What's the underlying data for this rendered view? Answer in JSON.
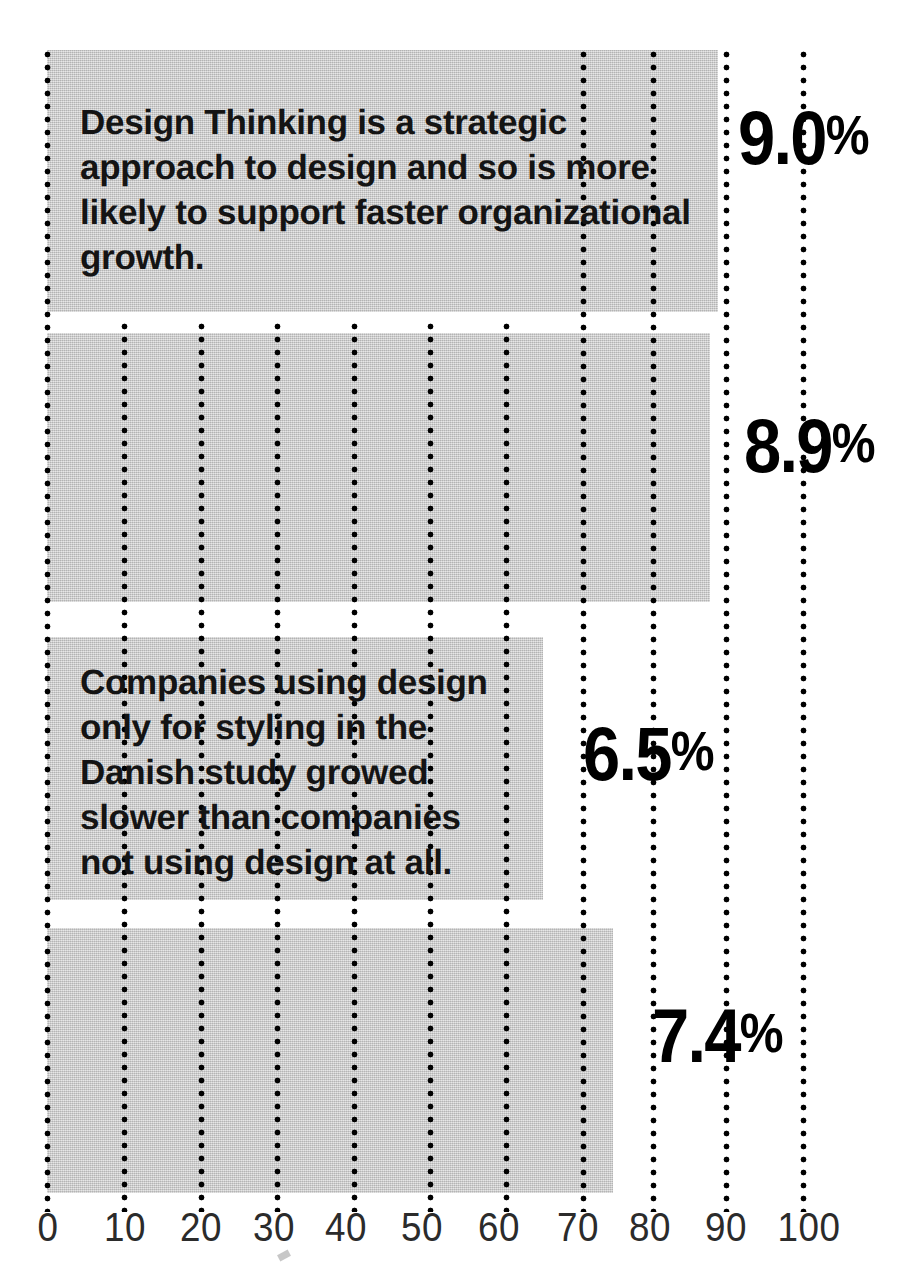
{
  "chart_data": {
    "type": "bar",
    "orientation": "horizontal",
    "title": "",
    "subtitle": "",
    "xlabel": "",
    "ylabel": "",
    "xlim": [
      0,
      100
    ],
    "grid": true,
    "grid_axis": "x",
    "legend": "none",
    "categories": [
      "Bar 1",
      "Bar 2",
      "Bar 3",
      "Bar 4"
    ],
    "values": [
      87,
      86,
      64,
      73
    ],
    "value_labels": [
      "9.0%",
      "8.9%",
      "6.5%",
      "7.4%"
    ],
    "tick_values": [
      0,
      10,
      20,
      30,
      40,
      50,
      60,
      70,
      80,
      90,
      100
    ],
    "tick_labels": [
      "0",
      "10",
      "20",
      "30",
      "40",
      "50",
      "60",
      "70",
      "80",
      "90",
      "100"
    ],
    "annotations": [
      {
        "bar_index": 0,
        "text": "Design Thinking is a strategic\napproach to design and so is more\nlikely to support faster organizational\ngrowth."
      },
      {
        "bar_index": 2,
        "text": "Companies using design\nonly for styling in the\nDanish study growed\nslower than companies\nnot using design at all."
      }
    ]
  },
  "bars": [
    {
      "name": "bar-1",
      "value_label": "9.0%",
      "value": 87,
      "left": 47,
      "top": 50,
      "width": 671,
      "height": 262,
      "label_left": 738,
      "label_top": 96,
      "note": "Design Thinking is a strategic\napproach to design and so is more\nlikely to support faster organizational\ngrowth.",
      "note_left": 80,
      "note_top": 100
    },
    {
      "name": "bar-2",
      "value_label": "8.9%",
      "value": 86,
      "left": 47,
      "top": 333,
      "width": 663,
      "height": 269,
      "label_left": 744,
      "label_top": 404,
      "note": "",
      "note_left": 0,
      "note_top": 0
    },
    {
      "name": "bar-3",
      "value_label": "6.5%",
      "value": 64,
      "left": 47,
      "top": 637,
      "width": 496,
      "height": 263,
      "label_left": 583,
      "label_top": 712,
      "note": "Companies using design\nonly for styling in the\nDanish study growed\nslower than companies\nnot using design at all.",
      "note_left": 80,
      "note_top": 660
    },
    {
      "name": "bar-4",
      "value_label": "7.4%",
      "value": 73,
      "left": 47,
      "top": 928,
      "width": 566,
      "height": 265,
      "label_left": 652,
      "label_top": 994,
      "note": "",
      "note_left": 0,
      "note_top": 0
    }
  ],
  "gridlines": [
    {
      "label": "0",
      "x": 47,
      "top": 46,
      "height": 1166
    },
    {
      "label": "10",
      "x": 124,
      "top": 318,
      "height": 894
    },
    {
      "label": "20",
      "x": 201,
      "top": 318,
      "height": 894
    },
    {
      "label": "30",
      "x": 277,
      "top": 318,
      "height": 894
    },
    {
      "label": "40",
      "x": 354,
      "top": 318,
      "height": 894
    },
    {
      "label": "50",
      "x": 430,
      "top": 318,
      "height": 894
    },
    {
      "label": "60",
      "x": 506,
      "top": 318,
      "height": 894
    },
    {
      "label": "70",
      "x": 583,
      "top": 46,
      "height": 1166
    },
    {
      "label": "80",
      "x": 653,
      "top": 46,
      "height": 1166
    },
    {
      "label": "90",
      "x": 726,
      "top": 46,
      "height": 1166
    },
    {
      "label": "100",
      "x": 803,
      "top": 46,
      "height": 1166
    }
  ],
  "axis": {
    "ticks": [
      {
        "label": "0",
        "x": 48
      },
      {
        "label": "10",
        "x": 125
      },
      {
        "label": "20",
        "x": 201
      },
      {
        "label": "30",
        "x": 274
      },
      {
        "label": "40",
        "x": 346
      },
      {
        "label": "50",
        "x": 422
      },
      {
        "label": "60",
        "x": 499
      },
      {
        "label": "70",
        "x": 578
      },
      {
        "label": "80",
        "x": 650
      },
      {
        "label": "90",
        "x": 726
      },
      {
        "label": "100",
        "x": 809
      }
    ]
  },
  "colors": {
    "bar_fill": "#c9c9c9",
    "gridline": "#000000",
    "text": "#141414",
    "value_label": "#000000",
    "tick_label": "#2b2b2b",
    "background": "#ffffff"
  }
}
